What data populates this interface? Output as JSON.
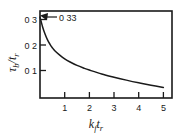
{
  "chart_data": {
    "type": "line",
    "title": "",
    "subtitle": "",
    "xlabel": "k_f t_r",
    "ylabel": "τ_b / t_r",
    "xlim": [
      0,
      5.35
    ],
    "ylim": [
      0,
      0.355
    ],
    "grid": false,
    "legend": null,
    "x_ticks": [
      1,
      2,
      3,
      4,
      5
    ],
    "x_tick_labels": [
      "1",
      "2",
      "3",
      "4",
      "5"
    ],
    "y_ticks": [
      0.1,
      0.2,
      0.3
    ],
    "y_tick_labels": [
      "0 1",
      "0 2",
      "0 3"
    ],
    "series": [
      {
        "name": "tau_b over t_r",
        "x": [
          0.0,
          0.1,
          0.2,
          0.3,
          0.4,
          0.5,
          0.6,
          0.8,
          1.0,
          1.2,
          1.5,
          1.8,
          2.0,
          2.5,
          3.0,
          3.5,
          4.0,
          4.5,
          5.0
        ],
        "values": [
          0.33,
          0.292,
          0.262,
          0.238,
          0.22,
          0.205,
          0.193,
          0.175,
          0.16,
          0.148,
          0.133,
          0.121,
          0.114,
          0.098,
          0.085,
          0.073,
          0.062,
          0.052,
          0.043
        ]
      }
    ],
    "annotations": [
      {
        "name": "start-value-callout",
        "text": "0 33",
        "value": 0.33,
        "points_to": {
          "x": 0.0,
          "y": 0.33
        }
      }
    ]
  },
  "axis_labels": {
    "y_tau": "τ",
    "y_sub_b": "b",
    "y_slash": "/",
    "y_t": "t",
    "y_sub_r": "r",
    "x_k": "k",
    "x_sub_f": "f",
    "x_t": "t",
    "x_sub_r": "r"
  },
  "colors": {
    "background": "#ffffff",
    "ink": "#1a1a1a",
    "curve": "#1a1a1a"
  }
}
